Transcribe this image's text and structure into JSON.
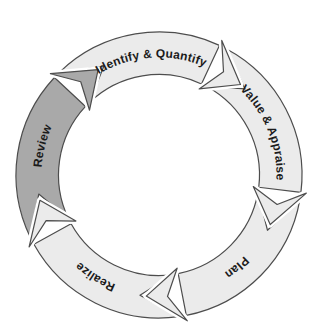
{
  "figure": {
    "type": "cycle-diagram",
    "direction": "clockwise",
    "segments": [
      {
        "id": "identify-quantify",
        "label": "Identify & Quantify",
        "highlighted": false
      },
      {
        "id": "value-appraise",
        "label": "Value & Appraise",
        "highlighted": false
      },
      {
        "id": "plan",
        "label": "Plan",
        "highlighted": false
      },
      {
        "id": "realize",
        "label": "Realize",
        "highlighted": false
      },
      {
        "id": "review",
        "label": "Review",
        "highlighted": true
      }
    ],
    "colors": {
      "background": "#ffffff",
      "segment_fill": "#ebebeb",
      "highlight_fill": "#a9a9a9",
      "outline": "#4d4d4d",
      "label_text": "#1b1b1b",
      "gap": "#ffffff"
    }
  }
}
